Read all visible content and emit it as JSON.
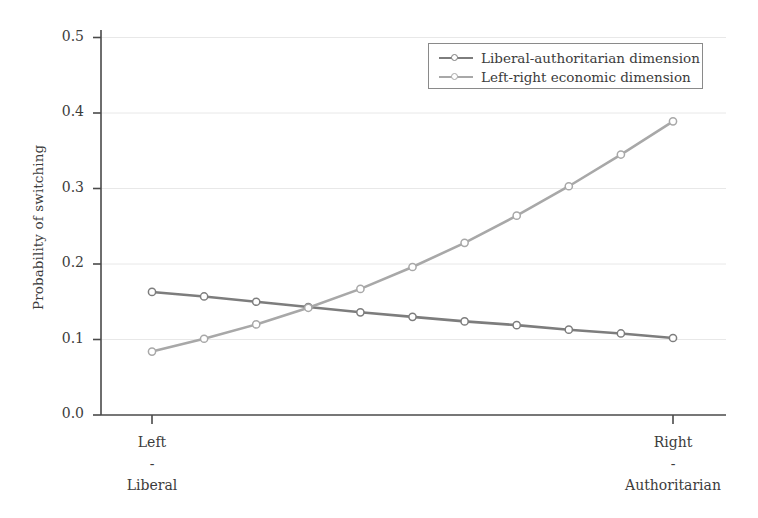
{
  "chart_data": {
    "type": "line",
    "title": "",
    "xlabel": "",
    "ylabel": "Probability of switching",
    "ylim": [
      0.0,
      0.5
    ],
    "xlim": [
      0,
      10
    ],
    "grid": true,
    "grid_axis": "y",
    "legend_position": "top-right",
    "x": [
      0,
      1,
      2,
      3,
      4,
      5,
      6,
      7,
      8,
      9,
      10
    ],
    "categories": [
      "Left\n-\nLiberal",
      "",
      "",
      "",
      "",
      "",
      "",
      "",
      "",
      "",
      "Right\n-\nAuthoritarian"
    ],
    "ytick_labels": [
      "0.0",
      "0.1",
      "0.2",
      "0.3",
      "0.4",
      "0.5"
    ],
    "ytick_values": [
      0.0,
      0.1,
      0.2,
      0.3,
      0.4,
      0.5
    ],
    "xtick_labels": [
      {
        "line1": "Left",
        "line2": "-",
        "line3": "Liberal"
      },
      {
        "line1": "Right",
        "line2": "-",
        "line3": "Authoritarian"
      }
    ],
    "series": [
      {
        "name": "Liberal-authoritarian dimension",
        "color": "#7d7d7d",
        "marker": "circle",
        "values": [
          0.163,
          0.157,
          0.15,
          0.143,
          0.136,
          0.13,
          0.124,
          0.119,
          0.113,
          0.108,
          0.102
        ]
      },
      {
        "name": "Left-right economic dimension",
        "color": "#a8a8a8",
        "marker": "circle",
        "values": [
          0.084,
          0.101,
          0.12,
          0.142,
          0.167,
          0.196,
          0.228,
          0.264,
          0.303,
          0.345,
          0.389
        ]
      }
    ]
  },
  "axis": {
    "ylabel": "Probability of switching",
    "line_color": "#4a4a4a",
    "grid_color": "#e8e8e8"
  },
  "legend": {
    "items": [
      {
        "label": "Liberal-authoritarian dimension",
        "color": "#7d7d7d"
      },
      {
        "label": "Left-right economic dimension",
        "color": "#a8a8a8"
      }
    ]
  }
}
